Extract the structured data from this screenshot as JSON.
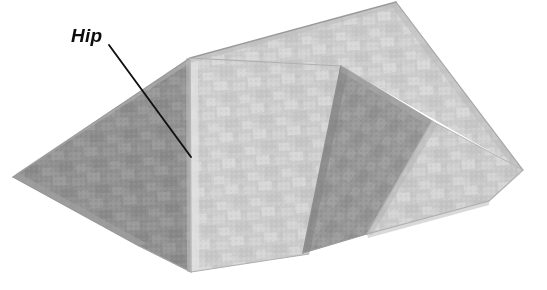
{
  "figure": {
    "background_color": "#ffffff",
    "width": 547,
    "height": 290
  },
  "annotations": [
    {
      "id": "hip",
      "label": "Hip",
      "text_color": "#0d0d0d",
      "leader_line": {
        "x1": 109,
        "y1": 45,
        "x2": 191,
        "y2": 157,
        "color": "#111111",
        "width": 1.9
      }
    }
  ],
  "colors": {
    "shadow_plane": "#8f8f8f",
    "shadow_plane_dark": "#858585",
    "lit_plane": "#cfcfcf",
    "lit_plane_bright": "#d9d9d9",
    "mid_plane": "#b4b4b4",
    "ridge_line": "#a8a8a8",
    "edge_line": "#8a8a8a",
    "shingle_light": "#dedede",
    "shingle_dark": "#9c9c9c"
  },
  "geometry": {
    "description": "Axonometric hip roof with intersecting gable wing",
    "surfaces": [
      {
        "name": "left-hip-end-slope",
        "shade": "shadow",
        "points": "13,177 190,58 191,270 140,246"
      },
      {
        "name": "front-main-slope",
        "shade": "lit",
        "points": "190,58 340,67 309,254 191,270"
      },
      {
        "name": "rear-main-slope-upper",
        "shade": "lit",
        "points": "190,58 395,2 522,170 340,67"
      },
      {
        "name": "wing-shadow-face",
        "shade": "shadow",
        "points": "340,67 430,120 366,233 303,253"
      },
      {
        "name": "wing-lit-slope",
        "shade": "lit",
        "points": "430,120 522,170 488,200 366,233"
      }
    ],
    "hip_ridge": {
      "x1": 190,
      "y1": 58,
      "x2": 191,
      "y2": 270
    },
    "apex": {
      "x": 190,
      "y": 58
    }
  }
}
